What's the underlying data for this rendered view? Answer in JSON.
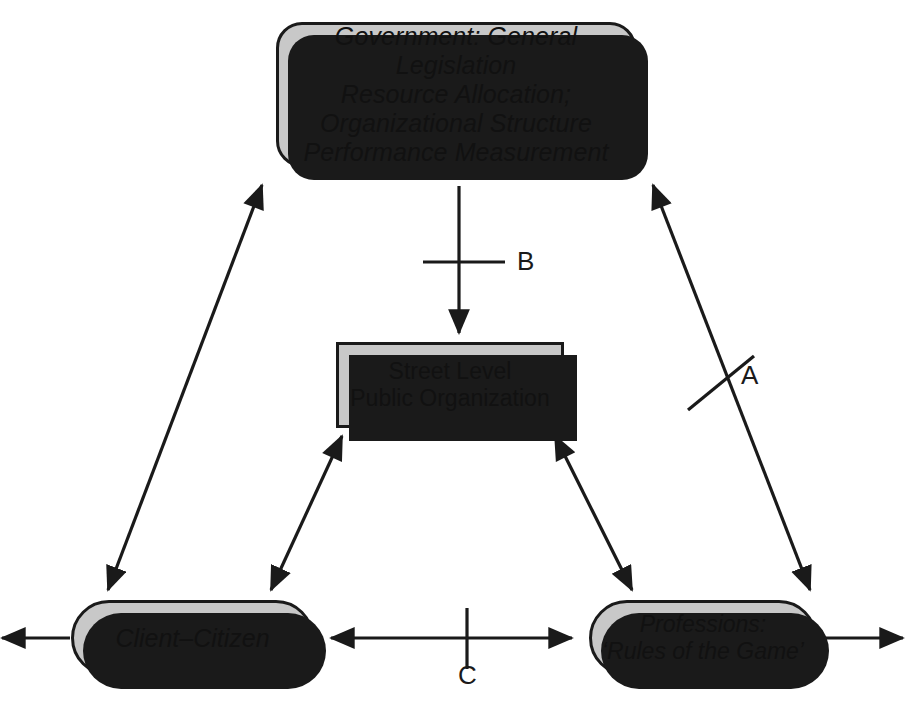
{
  "diagram": {
    "background_color": "#ffffff",
    "node_fill_color": "#c8c8c8",
    "node_stroke_color": "#1a1a1a",
    "shadow_color": "#1a1a1a",
    "arrow_color": "#1a1a1a"
  },
  "nodes": {
    "government": {
      "label": "Government: General Legislation\nResource Allocation;\nOrganizational Structure\nPerformance Measurement",
      "shape": "rounded-rectangle",
      "style": "italic"
    },
    "street_level": {
      "label": "Street Level\nPublic Organization",
      "shape": "rectangle",
      "style": "normal"
    },
    "client_citizen": {
      "label": "Client–Citizen",
      "shape": "pill",
      "style": "italic"
    },
    "professions": {
      "label": "Professions:\n‘Rules of the Game’",
      "shape": "pill",
      "style": "italic"
    }
  },
  "edges": [
    {
      "id": "gov-to-street",
      "label": "B",
      "from": "government",
      "to": "street_level",
      "arrowheads": "single",
      "direction": "down",
      "tick": "horizontal"
    },
    {
      "id": "gov-to-professions",
      "label": "A",
      "from": "government",
      "to": "professions",
      "arrowheads": "double",
      "direction": "diagonal",
      "tick": "cross"
    },
    {
      "id": "client-to-professions",
      "label": "C",
      "from": "client_citizen",
      "to": "professions",
      "arrowheads": "double",
      "direction": "horizontal",
      "tick": "vertical"
    },
    {
      "id": "gov-to-client",
      "label": "",
      "from": "government",
      "to": "client_citizen",
      "arrowheads": "double",
      "direction": "diagonal",
      "tick": "none"
    },
    {
      "id": "street-to-client",
      "label": "",
      "from": "street_level",
      "to": "client_citizen",
      "arrowheads": "double",
      "direction": "diagonal",
      "tick": "none"
    },
    {
      "id": "street-to-professions",
      "label": "",
      "from": "street_level",
      "to": "professions",
      "arrowheads": "double",
      "direction": "diagonal",
      "tick": "none"
    },
    {
      "id": "client-external-left",
      "label": "",
      "from": "client_citizen",
      "to": "external",
      "arrowheads": "single",
      "direction": "left",
      "tick": "none"
    },
    {
      "id": "professions-external-right",
      "label": "",
      "from": "professions",
      "to": "external",
      "arrowheads": "single",
      "direction": "right",
      "tick": "none"
    }
  ],
  "edge_labels": {
    "a": "A",
    "b": "B",
    "c": "C"
  }
}
